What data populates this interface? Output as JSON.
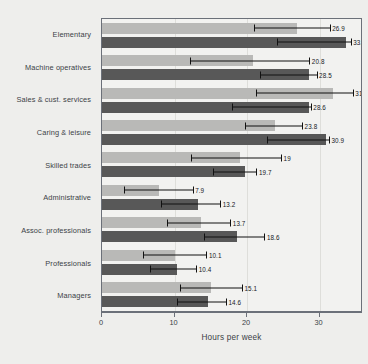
{
  "chart_data": {
    "type": "bar",
    "orientation": "horizontal",
    "title": "",
    "xlabel": "Hours per week",
    "ylabel": "",
    "xlim": [
      0,
      36
    ],
    "xticks": [
      0,
      10,
      20,
      30
    ],
    "grid": true,
    "legend": null,
    "categories": [
      "Elementary",
      "Machine operatives",
      "Sales & cust. services",
      "Caring & leisure",
      "Skilled trades",
      "Administrative",
      "Assoc. professionals",
      "Professionals",
      "Managers"
    ],
    "series": [
      {
        "name": "series-a",
        "color": "#b9b9b7",
        "values": [
          26.9,
          20.8,
          31.9,
          23.8,
          19,
          7.9,
          13.7,
          10.1,
          15.1
        ],
        "labels": [
          "26.9",
          "20.8",
          "31.9",
          "23.8",
          "19",
          "7.9",
          "13.7",
          "10.1",
          "15.1"
        ],
        "err_low": [
          21.0,
          12.1,
          21.3,
          19.7,
          12.3,
          3.0,
          9.0,
          5.6,
          10.8
        ],
        "err_high": [
          31.4,
          28.6,
          34.6,
          27.6,
          24.7,
          12.5,
          17.7,
          14.4,
          19.3
        ]
      },
      {
        "name": "series-b",
        "color": "#585858",
        "values": [
          33.6,
          28.5,
          28.6,
          30.9,
          19.7,
          13.2,
          18.6,
          10.4,
          14.6
        ],
        "labels": [
          "33.6",
          "28.5",
          "28.6",
          "30.9",
          "19.7",
          "13.2",
          "18.6",
          "10.4",
          "14.6"
        ],
        "err_low": [
          24.2,
          21.8,
          17.9,
          22.7,
          15.3,
          8.1,
          14.1,
          6.6,
          10.3
        ],
        "err_high": [
          34.3,
          29.6,
          28.8,
          31.3,
          21.3,
          16.3,
          22.4,
          13.0,
          17.1
        ]
      }
    ]
  },
  "axis": {
    "xtick_labels": [
      "0",
      "10",
      "20",
      "30"
    ],
    "x_title": "Hours per week"
  },
  "colors": {
    "background": "#eeeeec",
    "plot_background": "#f2f2f0",
    "frame": "#6b7079",
    "gridline": "#dededa",
    "series_a": "#b9b9b7",
    "series_b": "#585858",
    "text": "#3b3f46",
    "errorbar": "#111111"
  }
}
